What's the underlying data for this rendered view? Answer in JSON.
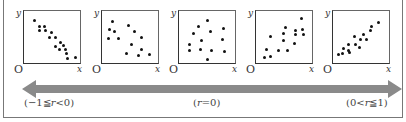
{
  "diagram": {
    "axis_labels": {
      "y": "y",
      "x": "x",
      "origin": "O"
    },
    "plots": [
      {
        "name": "strong-negative",
        "left": 23,
        "points": [
          [
            10,
            9
          ],
          [
            15,
            15
          ],
          [
            20,
            15
          ],
          [
            15,
            19
          ],
          [
            21,
            19
          ],
          [
            27,
            21
          ],
          [
            25,
            26
          ],
          [
            31,
            26
          ],
          [
            36,
            31
          ],
          [
            31,
            35
          ],
          [
            39,
            34
          ],
          [
            35,
            38
          ],
          [
            41,
            38
          ],
          [
            42,
            42
          ],
          [
            43,
            47
          ],
          [
            51,
            46
          ]
        ]
      },
      {
        "name": "weak-negative",
        "left": 101,
        "points": [
          [
            10,
            10
          ],
          [
            7,
            18
          ],
          [
            12,
            20
          ],
          [
            26,
            14
          ],
          [
            32,
            20
          ],
          [
            6,
            27
          ],
          [
            16,
            27
          ],
          [
            39,
            26
          ],
          [
            29,
            33
          ],
          [
            39,
            38
          ],
          [
            24,
            42
          ],
          [
            36,
            44
          ],
          [
            47,
            43
          ]
        ]
      },
      {
        "name": "no-correlation",
        "left": 178,
        "points": [
          [
            28,
            9
          ],
          [
            19,
            15
          ],
          [
            14,
            22
          ],
          [
            31,
            20
          ],
          [
            44,
            17
          ],
          [
            22,
            29
          ],
          [
            43,
            28
          ],
          [
            10,
            33
          ],
          [
            10,
            39
          ],
          [
            21,
            38
          ],
          [
            32,
            39
          ],
          [
            45,
            40
          ],
          [
            28,
            48
          ]
        ]
      },
      {
        "name": "weak-positive",
        "left": 255,
        "points": [
          [
            45,
            7
          ],
          [
            46,
            18
          ],
          [
            29,
            16
          ],
          [
            39,
            19
          ],
          [
            27,
            22
          ],
          [
            39,
            23
          ],
          [
            47,
            23
          ],
          [
            14,
            25
          ],
          [
            27,
            29
          ],
          [
            38,
            32
          ],
          [
            10,
            38
          ],
          [
            22,
            39
          ],
          [
            31,
            39
          ],
          [
            8,
            46
          ],
          [
            14,
            45
          ]
        ]
      },
      {
        "name": "strong-positive",
        "left": 332,
        "points": [
          [
            45,
            11
          ],
          [
            38,
            15
          ],
          [
            37,
            19
          ],
          [
            30,
            23
          ],
          [
            21,
            25
          ],
          [
            27,
            28
          ],
          [
            33,
            28
          ],
          [
            15,
            33
          ],
          [
            22,
            33
          ],
          [
            10,
            37
          ],
          [
            15,
            39
          ],
          [
            5,
            43
          ],
          [
            9,
            42
          ],
          [
            16,
            41
          ],
          [
            26,
            36
          ]
        ]
      }
    ],
    "arrow": {
      "color": "#8a8a8a",
      "direction": "bidirectional"
    },
    "ranges": [
      {
        "pre": "(−1≦",
        "var": "r",
        "post": "<0)"
      },
      {
        "pre": "(",
        "var": "r",
        "post": "=0)"
      },
      {
        "pre": "(0<",
        "var": "r",
        "post": "≦1)"
      }
    ]
  }
}
